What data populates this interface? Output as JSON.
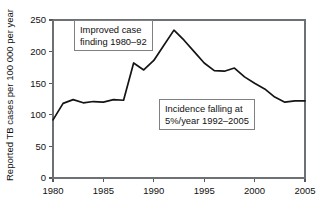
{
  "chart_data": {
    "type": "line",
    "title": "",
    "xlabel": "",
    "ylabel": "Reported TB cases per 100 000 per year",
    "xlim": [
      1980,
      2005
    ],
    "ylim": [
      0,
      250
    ],
    "grid": false,
    "legend": "none",
    "y_ticks": [
      0,
      50,
      100,
      150,
      200,
      250
    ],
    "y_tick_labels": [
      "0",
      "50",
      "100",
      "150",
      "200",
      "250"
    ],
    "x_ticks": [
      1980,
      1985,
      1990,
      1995,
      2000,
      2005
    ],
    "x_tick_labels": [
      "1980",
      "1985",
      "1990",
      "1995",
      "2000",
      "2005"
    ],
    "series": [
      {
        "name": "Reported TB incidence",
        "x": [
          1980,
          1981,
          1982,
          1983,
          1984,
          1985,
          1986,
          1987,
          1988,
          1989,
          1990,
          1991,
          1992,
          1993,
          1994,
          1995,
          1996,
          1997,
          1998,
          1999,
          2000,
          2001,
          2002,
          2003,
          2004,
          2005
        ],
        "values": [
          92,
          118,
          124,
          119,
          121,
          120,
          124,
          123,
          182,
          171,
          186,
          210,
          234,
          218,
          200,
          182,
          170,
          169,
          174,
          160,
          150,
          141,
          128,
          120,
          122,
          122
        ]
      }
    ],
    "annotations": [
      {
        "name": "improved-case-finding",
        "lines": [
          "Improved case",
          "finding 1980–92"
        ]
      },
      {
        "name": "incidence-falling",
        "lines": [
          "Incidence falling at",
          "5%/year 1992–2005"
        ]
      }
    ]
  }
}
